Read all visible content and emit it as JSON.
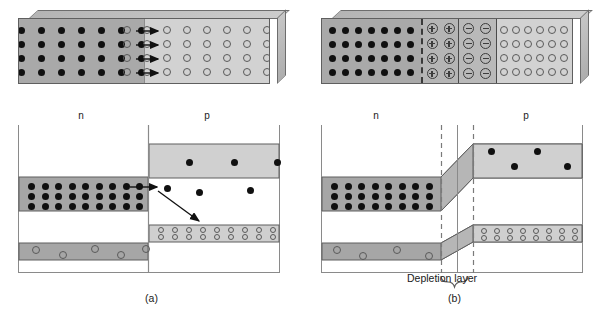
{
  "figure": {
    "colors": {
      "n_region": "#a9a9a9",
      "p_region": "#d2d2d2",
      "positive_ion_region": "#b5b5b5",
      "negative_ion_region": "#b9b9b9",
      "electron": "#101010",
      "hole": "#5a5a5a",
      "frame": "#8a8a8a",
      "dashed_boundary": "#7a7a7a",
      "arrow": "#111111"
    }
  },
  "panels": [
    {
      "id": "a",
      "caption": "(a)",
      "block": {
        "region_labels": {
          "n": "n",
          "p": "p"
        },
        "n_side": {
          "carrier": "electron",
          "glyph": "filled-dot",
          "rows": 4,
          "cols": 9
        },
        "p_side": {
          "carrier": "hole",
          "glyph": "open-circle",
          "rows": 4,
          "cols": 9
        },
        "diffusion_arrows": 4
      },
      "band_diagram": {
        "conduction_band": {
          "n_side": {
            "rows": 3,
            "cols": 9,
            "carrier": "electron"
          },
          "p_side": {
            "carriers": 6,
            "carrier": "electron"
          }
        },
        "valence_band": {
          "n_side": {
            "carriers": 5,
            "carrier": "hole"
          },
          "p_side": {
            "pairs": 9,
            "carrier": "hole"
          }
        },
        "junction": "abrupt",
        "recombination_arrow": true,
        "injection_arrow": true
      }
    },
    {
      "id": "b",
      "caption": "(b)",
      "block": {
        "region_labels": {
          "n": "n",
          "p": "p"
        },
        "n_side": {
          "carrier": "electron",
          "glyph": "filled-dot",
          "rows": 4,
          "cols": 7
        },
        "positive_ions": {
          "glyph": "circled-plus",
          "rows": 4,
          "cols": 2,
          "symbol": "+"
        },
        "negative_ions": {
          "glyph": "circled-minus",
          "rows": 4,
          "cols": 2,
          "symbol": "-"
        },
        "p_side": {
          "carrier": "hole",
          "glyph": "open-circle",
          "rows": 4,
          "cols": 6
        }
      },
      "band_diagram": {
        "conduction_band": {
          "n_side": {
            "rows": 3,
            "cols": 8,
            "carrier": "electron"
          },
          "p_side": {
            "carriers": 5,
            "carrier": "electron"
          }
        },
        "valence_band": {
          "n_side": {
            "carriers": 4,
            "carrier": "hole"
          },
          "p_side": {
            "pairs": 8,
            "carrier": "hole"
          }
        },
        "junction": "graded-band-bending",
        "depletion_label": "Depletion layer",
        "depletion_brace": true,
        "boundary_lines": [
          "dashed-left",
          "solid-junction",
          "dashed-right"
        ]
      }
    }
  ]
}
